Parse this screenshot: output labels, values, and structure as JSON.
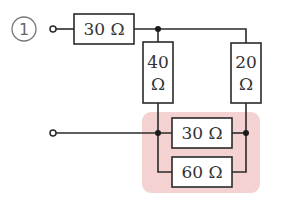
{
  "problem": {
    "number": "1",
    "highlight_color": "#f5d2d2"
  },
  "circuit": {
    "resistors": {
      "top_series": {
        "value": "30",
        "unit": "Ω",
        "label": "30 Ω"
      },
      "left_vertical": {
        "value": "40",
        "unit": "Ω",
        "line1": "40",
        "line2": "Ω"
      },
      "right_vertical": {
        "value": "20",
        "unit": "Ω",
        "line1": "20",
        "line2": "Ω"
      },
      "parallel_upper": {
        "value": "30",
        "unit": "Ω",
        "label": "30 Ω"
      },
      "parallel_lower": {
        "value": "60",
        "unit": "Ω",
        "label": "60 Ω"
      }
    },
    "terminals": [
      "top-terminal",
      "bottom-terminal"
    ]
  }
}
